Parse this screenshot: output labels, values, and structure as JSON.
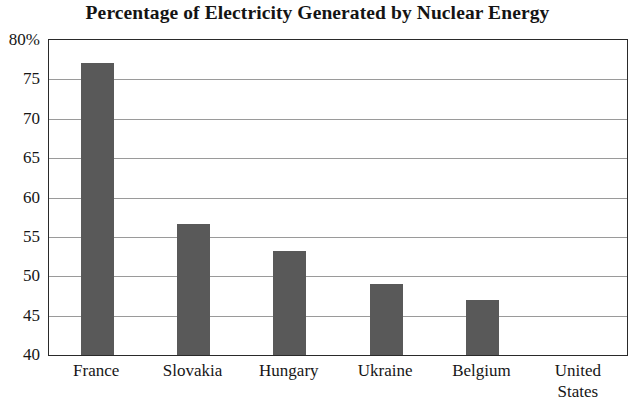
{
  "chart_data": {
    "type": "bar",
    "title": "Percentage of Electricity Generated by Nuclear Energy",
    "xlabel": "",
    "ylabel": "",
    "categories": [
      "France",
      "Slovakia",
      "Hungary",
      "Ukraine",
      "Belgium",
      "United\nStates"
    ],
    "values": [
      77.1,
      56.6,
      53.2,
      49.0,
      47.0,
      null
    ],
    "ylim": [
      40,
      80
    ],
    "ytick_values": [
      40,
      45,
      50,
      55,
      60,
      65,
      70,
      75,
      80
    ],
    "ytick_labels": [
      "40",
      "45",
      "50",
      "55",
      "60",
      "65",
      "70",
      "75",
      "80%"
    ],
    "grid": true,
    "legend": false,
    "bar_color": "#595959",
    "background_color": "#ffffff",
    "axis_color": "#2a2a2a",
    "gridline_color": "#9a9a9a"
  }
}
